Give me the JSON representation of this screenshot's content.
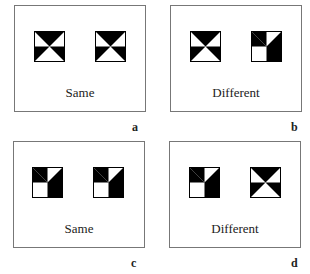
{
  "panels": [
    {
      "id": "a",
      "caption": "Same",
      "letter": "a",
      "left_icon": "horizontal",
      "right_icon": "horizontal"
    },
    {
      "id": "b",
      "caption": "Different",
      "letter": "b",
      "left_icon": "horizontal",
      "right_icon": "vertical"
    },
    {
      "id": "c",
      "caption": "Same",
      "letter": "c",
      "left_icon": "vertical",
      "right_icon": "vertical"
    },
    {
      "id": "d",
      "caption": "Different",
      "letter": "d",
      "left_icon": "vertical",
      "right_icon": "horizontal"
    }
  ],
  "colors": {
    "fill": "#000000",
    "background": "#ffffff",
    "border": "#777777"
  }
}
